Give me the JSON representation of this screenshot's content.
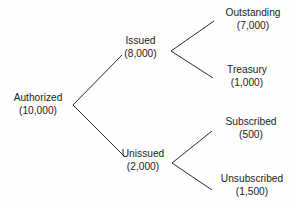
{
  "diagram": {
    "type": "tree",
    "orientation": "left-to-right",
    "line_color": "#2b2b2b",
    "text_color": "#1c1c1c",
    "background_color": "#ffffff",
    "nodes": {
      "authorized": {
        "label": "Authorized",
        "value": "(10,000)",
        "amount": 10000,
        "level": 0
      },
      "issued": {
        "label": "Issued",
        "value": "(8,000)",
        "amount": 8000,
        "level": 1
      },
      "unissued": {
        "label": "Unissued",
        "value": "(2,000)",
        "amount": 2000,
        "level": 1
      },
      "outstanding": {
        "label": "Outstanding",
        "value": "(7,000)",
        "amount": 7000,
        "level": 2
      },
      "treasury": {
        "label": "Treasury",
        "value": "(1,000)",
        "amount": 1000,
        "level": 2
      },
      "subscribed": {
        "label": "Subscribed",
        "value": "(500)",
        "amount": 500,
        "level": 2
      },
      "unsubscribed": {
        "label": "Unsubscribed",
        "value": "(1,500)",
        "amount": 1500,
        "level": 2
      }
    },
    "edges": [
      {
        "from": "authorized",
        "to": "issued"
      },
      {
        "from": "authorized",
        "to": "unissued"
      },
      {
        "from": "issued",
        "to": "outstanding"
      },
      {
        "from": "issued",
        "to": "treasury"
      },
      {
        "from": "unissued",
        "to": "subscribed"
      },
      {
        "from": "unissued",
        "to": "unsubscribed"
      }
    ]
  }
}
